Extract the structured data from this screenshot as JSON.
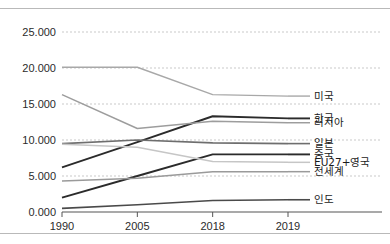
{
  "chart_data": {
    "type": "line",
    "title": "",
    "subtitle": "",
    "xlabel": "",
    "ylabel": "",
    "x": [
      "1990",
      "2005",
      "2018",
      "2019"
    ],
    "categories": [
      "1990",
      "2005",
      "2018",
      "2019"
    ],
    "y_ticks": [
      "0.000",
      "5.000",
      "10.000",
      "15.000",
      "20.000",
      "25.000"
    ],
    "y_tick_values": [
      0.0,
      5.0,
      10.0,
      15.0,
      20.0,
      25.0
    ],
    "ylim": [
      0.0,
      25.0
    ],
    "grid": true,
    "grid_style": "dashed-horizontal",
    "legend_position": "right-of-plot",
    "series": [
      {
        "name": "미국",
        "label": "미국",
        "color": "#a8a8a8",
        "width": 1.4,
        "values": [
          20.1,
          20.1,
          16.3,
          16.1
        ]
      },
      {
        "name": "한국",
        "label": "한국",
        "color": "#2b2b2b",
        "width": 1.9,
        "values": [
          6.2,
          9.7,
          13.3,
          13.0
        ]
      },
      {
        "name": "러시아",
        "label": "러시아",
        "color": "#9d9d9d",
        "width": 1.5,
        "values": [
          16.3,
          11.6,
          12.6,
          12.4
        ]
      },
      {
        "name": "일본",
        "label": "일본",
        "color": "#6e6e6e",
        "width": 1.6,
        "values": [
          9.5,
          10.0,
          9.6,
          9.5
        ]
      },
      {
        "name": "중국",
        "label": "중국",
        "color": "#2b2b2b",
        "width": 1.9,
        "values": [
          2.0,
          5.0,
          8.0,
          8.0
        ]
      },
      {
        "name": "EU27+영국",
        "label": "EU27+영국",
        "color": "#c6c6c6",
        "width": 1.5,
        "values": [
          9.4,
          9.0,
          7.0,
          6.9
        ]
      },
      {
        "name": "전세계",
        "label": "전세계",
        "color": "#9a9a9a",
        "width": 1.5,
        "values": [
          4.3,
          4.7,
          5.6,
          5.6
        ]
      },
      {
        "name": "인도",
        "label": "인도",
        "color": "#4a4a4a",
        "width": 1.6,
        "values": [
          0.5,
          1.0,
          1.6,
          1.7
        ]
      }
    ]
  },
  "axes": {
    "y_labels": [
      "25.000",
      "20.000",
      "15.000",
      "10.000",
      "5.000",
      "0.000"
    ],
    "x_labels": [
      "1990",
      "2005",
      "2018",
      "2019"
    ]
  },
  "legend": {
    "items": [
      {
        "label": "미국"
      },
      {
        "label": "한국"
      },
      {
        "label": "러시아"
      },
      {
        "label": "일본"
      },
      {
        "label": "중국"
      },
      {
        "label": "EU27+영국"
      },
      {
        "label": "전세계"
      },
      {
        "label": "인도"
      }
    ]
  },
  "colors": {
    "grid": "#c9c9c9",
    "axis": "#555555",
    "text": "#2b2b2b",
    "background": "#ffffff",
    "rule": "#b9b9b9"
  }
}
